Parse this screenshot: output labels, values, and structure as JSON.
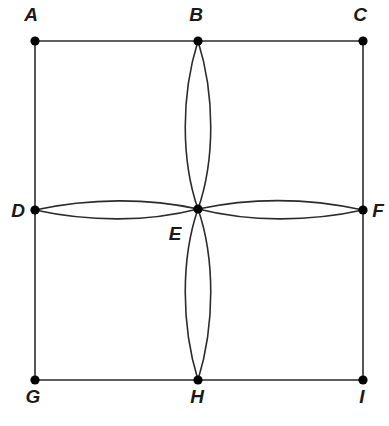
{
  "figure": {
    "type": "graph-diagram",
    "background_color": "#ffffff",
    "stroke_color": "#2b2b2b",
    "vertex_color": "#000000",
    "label_color": "#1a1a1a",
    "stroke_width": 1.6,
    "vertex_radius": 4.6,
    "canvas": {
      "width": 389,
      "height": 426
    }
  },
  "vertices": [
    {
      "id": "A",
      "label": "A",
      "x": 35,
      "y": 41,
      "label_x": 31,
      "label_y": 21,
      "label_anchor": "middle"
    },
    {
      "id": "B",
      "label": "B",
      "x": 198,
      "y": 41,
      "label_x": 196,
      "label_y": 21,
      "label_anchor": "middle"
    },
    {
      "id": "C",
      "label": "C",
      "x": 363,
      "y": 41,
      "label_x": 360,
      "label_y": 21,
      "label_anchor": "middle"
    },
    {
      "id": "D",
      "label": "D",
      "x": 35,
      "y": 210,
      "label_x": 18,
      "label_y": 217,
      "label_anchor": "middle"
    },
    {
      "id": "E",
      "label": "E",
      "x": 198,
      "y": 209,
      "label_x": 175,
      "label_y": 240,
      "label_anchor": "middle"
    },
    {
      "id": "F",
      "label": "F",
      "x": 363,
      "y": 210,
      "label_x": 378,
      "label_y": 217,
      "label_anchor": "middle"
    },
    {
      "id": "G",
      "label": "G",
      "x": 35,
      "y": 380,
      "label_x": 33,
      "label_y": 403,
      "label_anchor": "middle"
    },
    {
      "id": "H",
      "label": "H",
      "x": 198,
      "y": 380,
      "label_x": 197,
      "label_y": 403,
      "label_anchor": "middle"
    },
    {
      "id": "I",
      "label": "I",
      "x": 363,
      "y": 380,
      "label_x": 362,
      "label_y": 403,
      "label_anchor": "middle"
    }
  ],
  "straight_edges": [
    {
      "id": "A-B",
      "from": "A",
      "to": "B",
      "x1": 35,
      "y1": 41,
      "x2": 198,
      "y2": 41
    },
    {
      "id": "B-C",
      "from": "B",
      "to": "C",
      "x1": 198,
      "y1": 41,
      "x2": 363,
      "y2": 41
    },
    {
      "id": "A-D",
      "from": "A",
      "to": "D",
      "x1": 35,
      "y1": 41,
      "x2": 35,
      "y2": 210
    },
    {
      "id": "D-G",
      "from": "D",
      "to": "G",
      "x1": 35,
      "y1": 210,
      "x2": 35,
      "y2": 380
    },
    {
      "id": "C-F",
      "from": "C",
      "to": "F",
      "x1": 363,
      "y1": 41,
      "x2": 363,
      "y2": 210
    },
    {
      "id": "F-I",
      "from": "F",
      "to": "I",
      "x1": 363,
      "y1": 210,
      "x2": 363,
      "y2": 380
    },
    {
      "id": "G-H",
      "from": "G",
      "to": "H",
      "x1": 35,
      "y1": 380,
      "x2": 198,
      "y2": 380
    },
    {
      "id": "H-I",
      "from": "H",
      "to": "I",
      "x1": 198,
      "y1": 380,
      "x2": 363,
      "y2": 380
    }
  ],
  "curved_edges": [
    {
      "id": "B-E-left",
      "from": "B",
      "to": "E",
      "description": "left arc of vertical petal above center",
      "path": "M 198 41 C 181 95 181 160 198 209"
    },
    {
      "id": "B-E-right",
      "from": "B",
      "to": "E",
      "description": "right arc of vertical petal above center",
      "path": "M 198 41 C 215 95 215 160 198 209"
    },
    {
      "id": "E-H-left",
      "from": "E",
      "to": "H",
      "description": "left arc of vertical petal below center",
      "path": "M 198 209 C 181 258 181 325 198 380"
    },
    {
      "id": "E-H-right",
      "from": "E",
      "to": "H",
      "description": "right arc of vertical petal below center",
      "path": "M 198 209 C 215 258 215 325 198 380"
    },
    {
      "id": "D-E-top",
      "from": "D",
      "to": "E",
      "description": "upper arc of horizontal petal left of center",
      "path": "M 35 210 C 90 198 148 198 198 209"
    },
    {
      "id": "D-E-bottom",
      "from": "D",
      "to": "E",
      "description": "lower arc of horizontal petal left of center",
      "path": "M 35 210 C 90 222 148 222 198 209"
    },
    {
      "id": "E-F-top",
      "from": "E",
      "to": "F",
      "description": "upper arc of horizontal petal right of center",
      "path": "M 198 209 C 250 198 308 198 363 210"
    },
    {
      "id": "E-F-bottom",
      "from": "E",
      "to": "F",
      "description": "lower arc of horizontal petal right of center",
      "path": "M 198 209 C 250 222 308 222 363 210"
    }
  ]
}
